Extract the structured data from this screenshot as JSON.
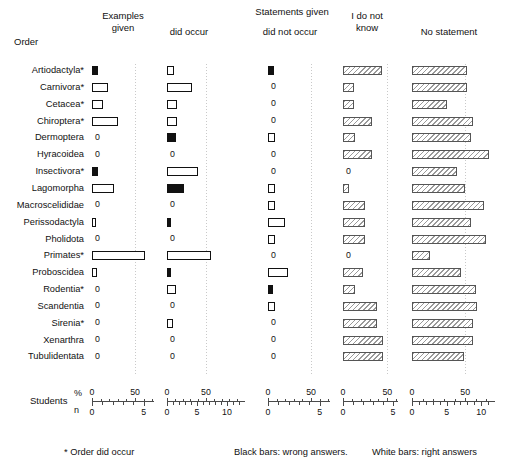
{
  "figure": {
    "row_axis_title": "Order",
    "group_header": "Statements given",
    "students_label": "Students",
    "unit_percent": "%",
    "unit_n": "n",
    "footnotes": [
      "* Order did occur",
      "Black bars: wrong answers.",
      "White bars: right answers"
    ]
  },
  "columns": [
    {
      "id": "examples-given",
      "header": "Examples\ngiven",
      "header_line1": "Examples",
      "header_line2": "given",
      "pct_ticks": [
        0,
        50
      ],
      "n_ticks": [
        0,
        5
      ],
      "pct_max": 72,
      "gridline_pct": 50
    },
    {
      "id": "did-occur",
      "header": "did occur",
      "header_line1": "did occur",
      "header_line2": "",
      "pct_ticks": [
        0,
        50
      ],
      "n_ticks": [
        0,
        5,
        10
      ],
      "pct_max": 100,
      "gridline_pct": 50
    },
    {
      "id": "did-not-occur",
      "header": "did not occur",
      "header_line1": "did not occur",
      "header_line2": "",
      "pct_ticks": [
        0,
        50
      ],
      "n_ticks": [
        0,
        5
      ],
      "pct_max": 72,
      "gridline_pct": 50
    },
    {
      "id": "i-do-not-know",
      "header": "I do not\nknow",
      "header_line1": "I do not",
      "header_line2": "know",
      "pct_ticks": [
        0,
        50
      ],
      "n_ticks": [
        0,
        5
      ],
      "pct_max": 62,
      "gridline_pct": 50
    },
    {
      "id": "no-statement",
      "header": "No statement",
      "header_line1": "No statement",
      "header_line2": "",
      "pct_ticks": [
        0,
        50
      ],
      "n_ticks": [
        0,
        5,
        10
      ],
      "pct_max": 78,
      "gridline_pct": 50
    }
  ],
  "chart_data": {
    "type": "bar",
    "title": "",
    "subtitle": "",
    "xlabel": "Students (% / n)",
    "ylabel": "Order",
    "grid": true,
    "legend_position": "bottom",
    "orientation": "horizontal",
    "panels": [
      "Examples given",
      "did occur",
      "did not occur",
      "I do not know",
      "No statement"
    ],
    "categories": [
      "Artiodactyla*",
      "Carnivora*",
      "Cetacea*",
      "Chiroptera*",
      "Dermoptera",
      "Hyracoidea",
      "Insectivora*",
      "Lagomorpha",
      "Macroscelididae",
      "Perissodactyla",
      "Pholidota",
      "Primates*",
      "Proboscidea",
      "Rodentia*",
      "Scandentia",
      "Sirenia*",
      "Xenarthra",
      "Tubulidentata"
    ],
    "series": [
      {
        "name": "Examples given",
        "panel": 0,
        "values": [
          7,
          19,
          13,
          30,
          0,
          0,
          7,
          25,
          0,
          5,
          0,
          61,
          6,
          0,
          0,
          0,
          0,
          0
        ],
        "fills": [
          "black",
          "white",
          "white",
          "white",
          "zero",
          "zero",
          "black",
          "white",
          "zero",
          "white",
          "zero",
          "white",
          "white",
          "zero",
          "zero",
          "zero",
          "zero",
          "zero"
        ]
      },
      {
        "name": "did occur",
        "panel": 1,
        "values": [
          9,
          32,
          13,
          13,
          11,
          0,
          40,
          22,
          0,
          5,
          0,
          56,
          5,
          11,
          0,
          8,
          0,
          0
        ],
        "fills": [
          "white",
          "white",
          "white",
          "white",
          "black",
          "zero",
          "white",
          "black",
          "zero",
          "black",
          "zero",
          "white",
          "black",
          "white",
          "zero",
          "white",
          "zero",
          "zero"
        ]
      },
      {
        "name": "did not occur",
        "panel": 2,
        "values": [
          7,
          0,
          0,
          0,
          8,
          0,
          0,
          8,
          8,
          20,
          8,
          0,
          23,
          6,
          8,
          0,
          0,
          0
        ],
        "fills": [
          "black",
          "zero",
          "zero",
          "zero",
          "white",
          "zero",
          "zero",
          "white",
          "white",
          "white",
          "white",
          "zero",
          "white",
          "black",
          "white",
          "zero",
          "zero",
          "zero"
        ]
      },
      {
        "name": "I do not know",
        "panel": 3,
        "values": [
          44,
          12,
          12,
          33,
          14,
          33,
          0,
          7,
          25,
          25,
          25,
          0,
          22,
          14,
          38,
          38,
          45,
          45
        ],
        "fills": [
          "hatch",
          "hatch",
          "hatch",
          "hatch",
          "hatch",
          "hatch",
          "zero",
          "hatch",
          "hatch",
          "hatch",
          "hatch",
          "zero",
          "hatch",
          "hatch",
          "hatch",
          "hatch",
          "hatch",
          "hatch"
        ]
      },
      {
        "name": "No statement",
        "panel": 4,
        "values": [
          52,
          52,
          33,
          57,
          55,
          72,
          42,
          50,
          68,
          55,
          70,
          17,
          46,
          60,
          61,
          57,
          57,
          49
        ],
        "fills": [
          "hatch",
          "hatch",
          "hatch",
          "hatch",
          "hatch",
          "hatch",
          "hatch",
          "hatch",
          "hatch",
          "hatch",
          "hatch",
          "hatch",
          "hatch",
          "hatch",
          "hatch",
          "hatch",
          "hatch",
          "hatch"
        ]
      }
    ],
    "pct_axis_ranges": [
      [
        0,
        72
      ],
      [
        0,
        100
      ],
      [
        0,
        72
      ],
      [
        0,
        62
      ],
      [
        0,
        78
      ]
    ],
    "n_axis_ranges": [
      [
        0,
        6
      ],
      [
        0,
        13
      ],
      [
        0,
        6
      ],
      [
        0,
        5.5
      ],
      [
        0,
        12
      ]
    ],
    "annotations": [
      "* Order did occur",
      "Black bars: wrong answers.",
      "White bars: right answers"
    ]
  }
}
